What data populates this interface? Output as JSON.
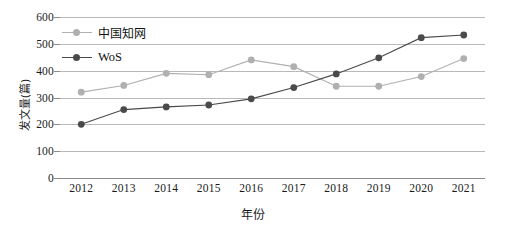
{
  "chart_data": {
    "type": "line",
    "title": "",
    "xlabel": "年份",
    "ylabel": "发文量(篇)",
    "categories": [
      "2012",
      "2013",
      "2014",
      "2015",
      "2016",
      "2017",
      "2018",
      "2019",
      "2020",
      "2021"
    ],
    "x": [
      2012,
      2013,
      2014,
      2015,
      2016,
      2017,
      2018,
      2019,
      2020,
      2021
    ],
    "ylim": [
      0,
      600
    ],
    "ytick_labels": [
      "0",
      "100",
      "200",
      "300",
      "400",
      "500",
      "600"
    ],
    "yticks": [
      0,
      100,
      200,
      300,
      400,
      500,
      600
    ],
    "grid": "horizontal",
    "legend_position": "upper-left",
    "series": [
      {
        "name": "中国知网",
        "color": "#b0b0b0",
        "marker": "circle",
        "values": [
          320,
          345,
          390,
          385,
          440,
          415,
          342,
          342,
          378,
          445
        ]
      },
      {
        "name": "WoS",
        "color": "#4a4a4a",
        "marker": "circle",
        "values": [
          200,
          255,
          265,
          272,
          295,
          337,
          388,
          448,
          523,
          533
        ]
      }
    ]
  },
  "axes": {
    "y_label": "发文量(篇)",
    "x_label": "年份"
  },
  "colors": {
    "series_cnki": "#b0b0b0",
    "series_wos": "#4a4a4a",
    "gridline": "#b9b9b9",
    "axis": "#8a8a8a",
    "text": "#1a1a1a",
    "background": "#ffffff"
  }
}
